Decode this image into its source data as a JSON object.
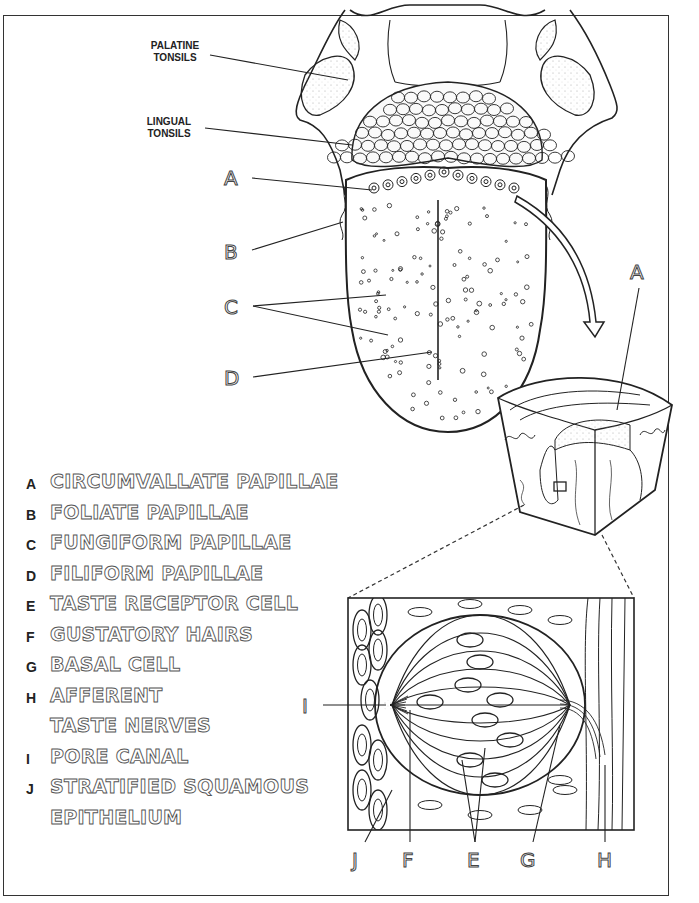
{
  "callouts": {
    "palatine_tonsils": [
      "PALATINE",
      "TONSILS"
    ],
    "lingual_tonsils": [
      "LINGUAL",
      "TONSILS"
    ]
  },
  "tongue_labels": [
    "A",
    "B",
    "C",
    "D"
  ],
  "cube_label": "A",
  "taste_bud_labels": {
    "left": "I",
    "bottom": [
      "J",
      "F",
      "E",
      "G",
      "H"
    ]
  },
  "legend": [
    {
      "key": "A",
      "term": "CIRCUMVALLATE PAPILLAE"
    },
    {
      "key": "B",
      "term": "FOLIATE PAPILLAE"
    },
    {
      "key": "C",
      "term": "FUNGIFORM PAPILLAE"
    },
    {
      "key": "D",
      "term": "FILIFORM PAPILLAE"
    },
    {
      "key": "E",
      "term": "TASTE RECEPTOR CELL"
    },
    {
      "key": "F",
      "term": "GUSTATORY HAIRS"
    },
    {
      "key": "G",
      "term": "BASAL CELL"
    },
    {
      "key": "H",
      "term": "AFFERENT"
    },
    {
      "key": "",
      "term": "TASTE NERVES"
    },
    {
      "key": "I",
      "term": "PORE CANAL"
    },
    {
      "key": "J",
      "term": "STRATIFIED SQUAMOUS"
    },
    {
      "key": "",
      "term": "EPITHELIUM"
    }
  ],
  "colors": {
    "ink": "#222222",
    "paper": "#ffffff"
  }
}
